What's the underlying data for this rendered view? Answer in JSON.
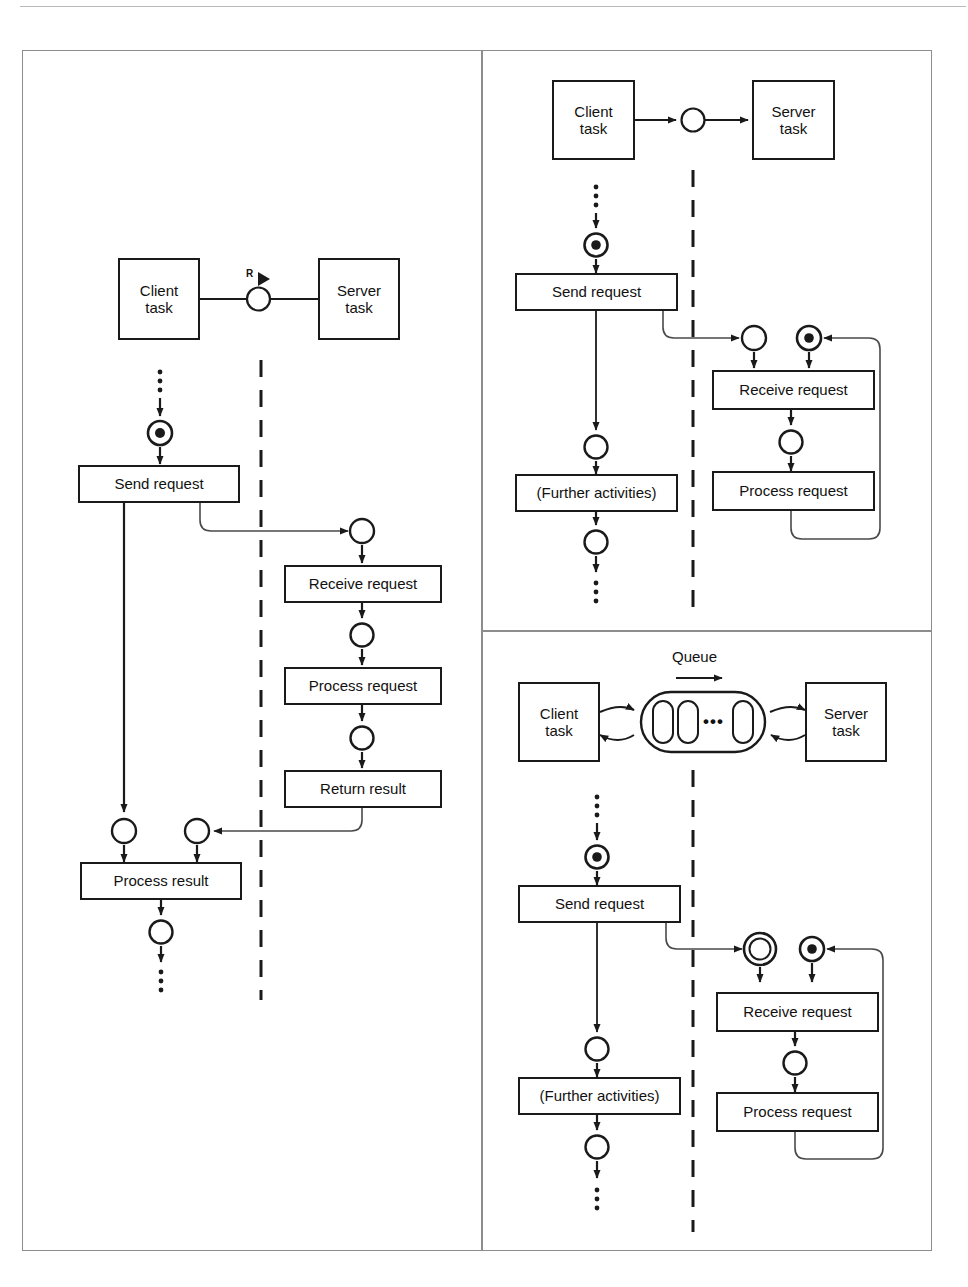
{
  "figure": {
    "panels": [
      {
        "id": "synchronous-rpc",
        "position": "left",
        "component_row": {
          "client_label": "Client\ntask",
          "client_label_line1": "Client",
          "client_label_line2": "task",
          "server_label_line1": "Server",
          "server_label_line2": "task",
          "interface_letter": "R",
          "interface_marker": "provided-interface-ball-and-socket"
        },
        "client_lane": {
          "start_ellipsis": "⋮",
          "activities": [
            "Send request",
            "Process result"
          ],
          "end_ellipsis": "⋮"
        },
        "server_lane": {
          "activities": [
            "Receive request",
            "Process request",
            "Return result"
          ]
        }
      },
      {
        "id": "asynchronous-message",
        "position": "top-right",
        "component_row": {
          "client_label_line1": "Client",
          "client_label_line2": "task",
          "server_label_line1": "Server",
          "server_label_line2": "task"
        },
        "client_lane": {
          "start_ellipsis": "⋮",
          "activities": [
            "Send request",
            "(Further activities)"
          ],
          "end_ellipsis": "⋮"
        },
        "server_lane": {
          "activities": [
            "Receive request",
            "Process request"
          ]
        }
      },
      {
        "id": "queued-message",
        "position": "bottom-right",
        "queue_label": "Queue",
        "queue_slots_ellipsis": "•••",
        "component_row": {
          "client_label_line1": "Client",
          "client_label_line2": "task",
          "server_label_line1": "Server",
          "server_label_line2": "task"
        },
        "client_lane": {
          "start_ellipsis": "⋮",
          "activities": [
            "Send request",
            "(Further activities)"
          ],
          "end_ellipsis": "⋮"
        },
        "server_lane": {
          "activities": [
            "Receive request",
            "Process request"
          ]
        }
      }
    ],
    "colors": {
      "stroke": "#1a1a1a",
      "thin_stroke": "#4a4a4a",
      "frame": "#8d8d8d",
      "background": "#ffffff"
    }
  }
}
